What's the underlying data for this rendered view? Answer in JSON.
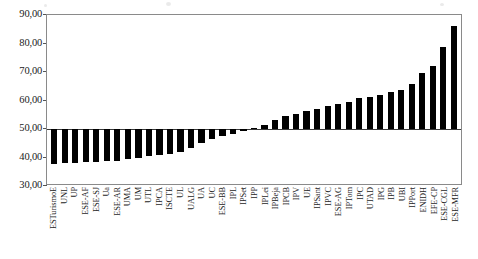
{
  "chart_data": {
    "type": "bar",
    "title": "",
    "subtitle": "",
    "xlabel": "",
    "ylabel": "",
    "ylim": [
      30.0,
      90.0
    ],
    "yticks": [
      30.0,
      40.0,
      50.0,
      60.0,
      70.0,
      80.0,
      90.0
    ],
    "ytick_labels": [
      "30,00",
      "40,00",
      "50,00",
      "60,00",
      "70,00",
      "80,00",
      "90,00"
    ],
    "baseline": 50.0,
    "grid": false,
    "legend": null,
    "bar_color": "#000000",
    "decimal_separator": ",",
    "categories": [
      "ESTurismoE",
      "UNL",
      "UP",
      "ESE-AF",
      "ESE-SJ",
      "Ua",
      "ESE-AR",
      "UMA",
      "UM",
      "UTL",
      "IPCA",
      "ISCTE",
      "UL",
      "UALG",
      "UA",
      "UC",
      "ESE-BB",
      "IPL",
      "IPSet",
      "IPP",
      "IPLei",
      "IPBeja",
      "IPCB",
      "IPV",
      "UE",
      "IPSant",
      "IPVC",
      "ESE-AG",
      "IPTom",
      "IPC",
      "UTAD",
      "IPG",
      "IPB",
      "UBI",
      "IPPort",
      "ENIDH",
      "EFE-CP",
      "ESE-CGL",
      "ESE-MFR"
    ],
    "values": [
      37.6,
      38.1,
      38.2,
      38.3,
      38.4,
      38.6,
      38.9,
      39.6,
      40.0,
      40.4,
      40.8,
      41.2,
      41.8,
      43.5,
      45.0,
      46.6,
      47.6,
      48.4,
      49.2,
      50.3,
      51.5,
      53.3,
      54.6,
      55.4,
      56.2,
      57.0,
      58.0,
      58.6,
      59.5,
      61.0,
      61.4,
      62.0,
      63.1,
      63.6,
      65.8,
      69.8,
      72.0,
      78.6,
      86.0
    ]
  }
}
